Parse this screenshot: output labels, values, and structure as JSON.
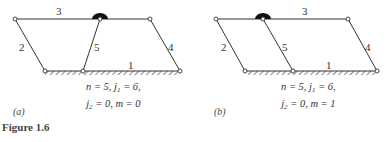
{
  "figure_caption": "Figure 1.6",
  "panels": [
    {
      "id": "a",
      "label": "(a)",
      "link_labels": [
        "1",
        "2",
        "3",
        "4",
        "5"
      ],
      "eq_line1": {
        "n": "n = 5, j",
        "j_sub": "1",
        "rest": " = 6,"
      },
      "eq_line2": {
        "pre": "j",
        "j_sub": "2",
        "rest": " = 0, m = 0"
      }
    },
    {
      "id": "b",
      "label": "(b)",
      "link_labels": [
        "1",
        "2",
        "3",
        "4",
        "5"
      ],
      "eq_line1": {
        "n": "n = 5, j",
        "j_sub": "1",
        "rest": " = 6,"
      },
      "eq_line2": {
        "pre": "j",
        "j_sub": "2",
        "rest": " = 0, m = 1"
      }
    }
  ]
}
